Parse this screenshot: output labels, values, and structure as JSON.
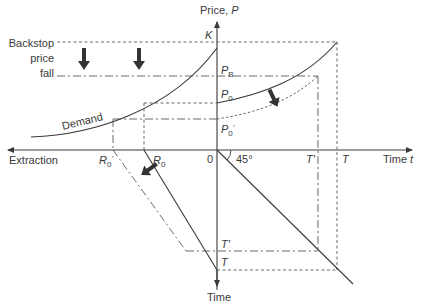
{
  "diagram": {
    "axes": {
      "price_axis_label": "Price, ",
      "price_axis_symbol": "P",
      "time_axis_label": "Time ",
      "time_axis_symbol": "t",
      "extraction_axis_label": "Extraction",
      "lower_time_axis_label": "Time",
      "origin_label": "0",
      "angle_label": "45°"
    },
    "price_labels": {
      "K": "K",
      "PB": "P",
      "PB_sub": "B",
      "P0": "P",
      "P0_sub": "0",
      "P0prime": "P",
      "P0prime_sub": "0",
      "P0prime_mark": "'"
    },
    "time_labels": {
      "T_prime_top": "T'",
      "T_top": "T",
      "T_prime_bottom": "T'",
      "T_bottom": "T"
    },
    "extraction_labels": {
      "R0_prime": "R",
      "R0_prime_sub": "0",
      "R0_prime_mark": "'",
      "R0": "R",
      "R0_sub": "0"
    },
    "curve_labels": {
      "demand": "Demand"
    },
    "annotations": {
      "backstop_line1": "Backstop",
      "backstop_line2": "price",
      "backstop_line3": "fall"
    },
    "colors": {
      "line": "#3a3a3a",
      "dashed": "#5a5a5a",
      "arrow": "#333333",
      "background": "#ffffff"
    }
  }
}
